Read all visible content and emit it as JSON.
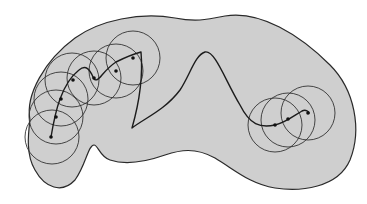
{
  "diagram": {
    "colors": {
      "region_fill": "#cfcfcf",
      "outline": "#2a2a2a",
      "path": "#1c1c1c",
      "background": "#ffffff"
    },
    "left_cluster": {
      "circle_count": 7,
      "node_count": 7
    },
    "right_cluster": {
      "circle_count": 3,
      "node_count": 3
    }
  }
}
